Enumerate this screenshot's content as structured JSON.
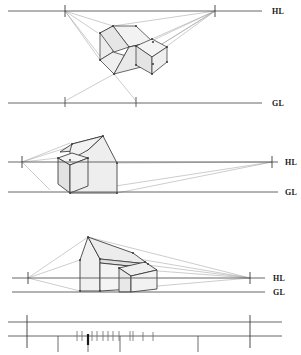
{
  "page": {
    "background_color": "#ffffff",
    "width": 301,
    "height": 355
  },
  "style": {
    "reference_line_color": "#555555",
    "construction_line_color": "#9a9a9a",
    "object_outline_color": "#2b2b2b",
    "face_light_fill": "#f2f2f2",
    "face_mid_fill": "#e6e6e6",
    "face_dark_fill": "#d9d9d9",
    "roof_fill": "#ececec",
    "vertex_color": "#3a3a3a",
    "label_color": "#1a1a1a"
  },
  "panels": [
    {
      "id": "panel-birdseye",
      "name": "bird-eye-view-above-horizon",
      "horizon_label": "HL",
      "ground_label": "GL",
      "horizon_y": 11,
      "ground_y": 103,
      "left_vanishing_point": {
        "x": 65,
        "y": 11
      },
      "right_vanishing_point": {
        "x": 215,
        "y": 11
      },
      "ground_measure_marks_x": [
        65,
        135
      ],
      "object": {
        "name": "house-with-annex",
        "description": "gable house seen from above the horizon line"
      }
    },
    {
      "id": "panel-worms-eye",
      "name": "low-eye-level-view",
      "horizon_label": "HL",
      "ground_label": "GL",
      "horizon_y": 162,
      "ground_y": 192,
      "left_vanishing_point": {
        "x": 22,
        "y": 162
      },
      "right_vanishing_point": {
        "x": 272,
        "y": 162
      },
      "object": {
        "name": "house-with-annex",
        "description": "gable house seen near eye level, close viewpoint"
      }
    },
    {
      "id": "panel-eye-level",
      "name": "normal-eye-level-view",
      "horizon_label": "HL",
      "ground_label": "GL",
      "horizon_y": 278,
      "ground_y": 292,
      "left_vanishing_point": {
        "x": 28,
        "y": 278
      },
      "right_vanishing_point": {
        "x": 250,
        "y": 278
      },
      "object": {
        "name": "house-with-annex",
        "description": "gable house seen from normal standing eye level"
      }
    }
  ],
  "measuring_strip": {
    "id": "measuring-strip",
    "name": "measuring-line-strip",
    "top_line_y": 322,
    "bottom_line_y": 336,
    "major_marks_x": [
      27,
      250
    ],
    "lower_major_marks_x": [
      27,
      58,
      88,
      120,
      198,
      250
    ],
    "minor_marks_x": [
      77,
      82,
      92,
      97,
      103,
      108,
      113,
      119,
      130,
      133,
      143,
      153
    ],
    "emphasis_mark_x": 88
  }
}
